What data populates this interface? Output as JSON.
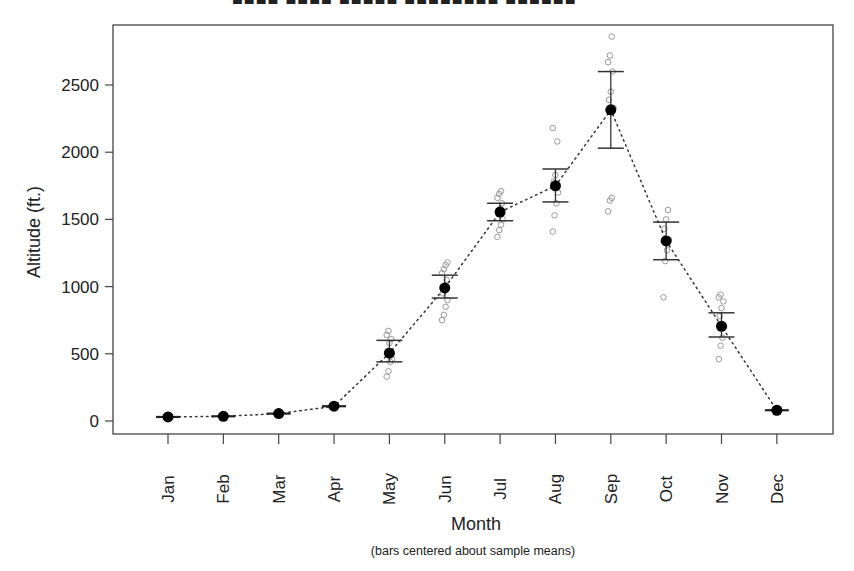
{
  "chart_data": {
    "type": "scatter",
    "title": "",
    "xlabel": "Month",
    "ylabel": "Altitude (ft.)",
    "caption": "(bars centered about sample means)",
    "categories": [
      "Jan",
      "Feb",
      "Mar",
      "Apr",
      "May",
      "Jun",
      "Jul",
      "Aug",
      "Sep",
      "Oct",
      "Nov",
      "Dec"
    ],
    "yticks": [
      0,
      500,
      1000,
      1500,
      2000,
      2500
    ],
    "ylim": [
      -100,
      2900
    ],
    "grid": false,
    "legend": null,
    "series": [
      {
        "name": "Mean altitude",
        "style": "filled-circle with dotted line",
        "values": [
          30,
          35,
          55,
          110,
          505,
          990,
          1555,
          1750,
          2315,
          1340,
          705,
          80
        ]
      },
      {
        "name": "Error bar lower",
        "values": [
          30,
          35,
          55,
          110,
          440,
          915,
          1490,
          1630,
          2030,
          1200,
          625,
          80
        ]
      },
      {
        "name": "Error bar upper",
        "values": [
          30,
          35,
          55,
          110,
          600,
          1085,
          1620,
          1875,
          2600,
          1480,
          805,
          80
        ]
      },
      {
        "name": "Individual observations",
        "style": "open grey circles",
        "points": {
          "Jan": [
            30
          ],
          "Feb": [
            35
          ],
          "Mar": [
            55
          ],
          "Apr": [
            105,
            115
          ],
          "May": [
            330,
            370,
            440,
            460,
            520,
            580,
            610,
            640,
            670
          ],
          "Jun": [
            750,
            790,
            850,
            900,
            950,
            1000,
            1050,
            1100,
            1130,
            1160,
            1180
          ],
          "Jul": [
            1370,
            1420,
            1460,
            1500,
            1540,
            1580,
            1620,
            1660,
            1690,
            1710
          ],
          "Aug": [
            1410,
            1530,
            1620,
            1700,
            1780,
            1830,
            2080,
            2180
          ],
          "Sep": [
            1560,
            1640,
            1660,
            2330,
            2390,
            2450,
            2600,
            2670,
            2720,
            2860
          ],
          "Oct": [
            920,
            1190,
            1270,
            1350,
            1430,
            1500,
            1570
          ],
          "Nov": [
            460,
            560,
            620,
            700,
            780,
            840,
            890,
            920,
            940
          ],
          "Dec": [
            80
          ]
        }
      }
    ]
  },
  "labels": {
    "title_partial": "■■■■ ■■■■ ■■■■■ ■■■■■■■■ ■■■■■■"
  }
}
